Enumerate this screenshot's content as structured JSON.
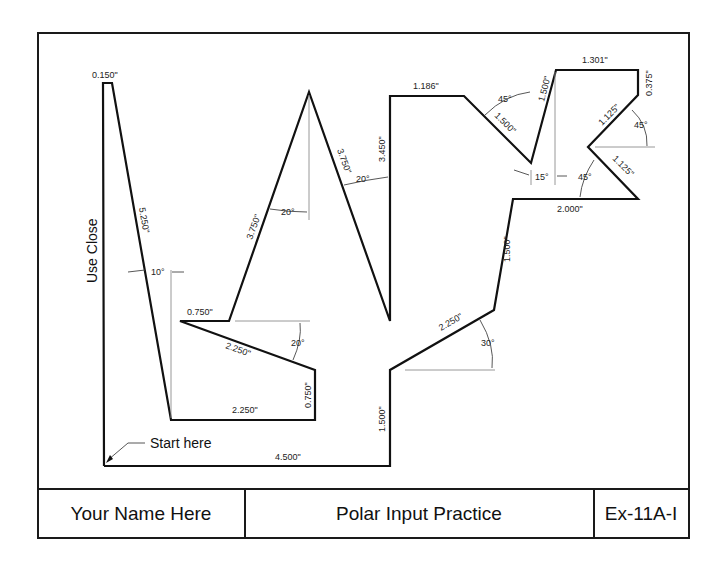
{
  "title_block": {
    "name": "Your Name Here",
    "title": "Polar Input Practice",
    "exercise": "Ex-11A-I"
  },
  "annotations": {
    "start": "Start here",
    "close": "Use Close"
  },
  "dimensions": {
    "d_0150": "0.150\"",
    "d_5250": "5.250\"",
    "a_10": "10°",
    "d_0750_top": "0.750\"",
    "d_2250_slope": "2.250\"",
    "a_20_lower": "20°",
    "d_0750_vert": "0.750\"",
    "d_2250_base": "2.250\"",
    "d_4500": "4.500\"",
    "d_3750_left": "3.750\"",
    "a_20_peak": "20°",
    "d_3750_right": "3.750\"",
    "a_20_right": "20°",
    "d_3450": "3.450\"",
    "d_1186": "1.186\"",
    "a_45_top": "45°",
    "d_1500_diag": "1.500\"",
    "d_1500_up": "1.500\"",
    "a_15": "15°",
    "d_1301": "1.301\"",
    "d_0375": "0.375\"",
    "d_1125_upper": "1.125\"",
    "a_45_right": "45°",
    "d_1125_lower": "1.125\"",
    "a_45_lower": "45°",
    "d_2000": "2.000\"",
    "d_1500_mid": "1.500\"",
    "d_2250_right": "2.250\"",
    "a_30": "30°",
    "d_1500_bottom": "1.500\""
  },
  "colors": {
    "line": "#111111",
    "extension": "#8c8c8c",
    "background": "#ffffff"
  }
}
